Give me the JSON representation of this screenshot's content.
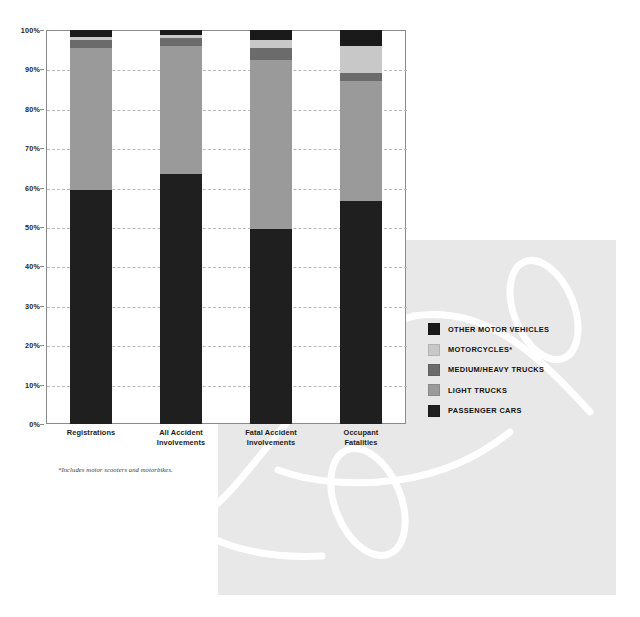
{
  "chart_data": {
    "type": "bar",
    "subtype": "stacked-bar-100-percent",
    "title": "",
    "xlabel": "",
    "ylabel": "",
    "ylim": [
      0,
      100
    ],
    "ytick_step": 10,
    "grid": true,
    "grid_style": "dashed horizontal",
    "legend_position": "right",
    "value_unit": "%",
    "categories": [
      "Registrations",
      "All Accident Involvements",
      "Fatal Accident Involvements",
      "Occupant Fatalities"
    ],
    "category_lines": [
      [
        "Registrations"
      ],
      [
        "All Accident",
        "Involvements"
      ],
      [
        "Fatal Accident",
        "Involvements"
      ],
      [
        "Occupant",
        "Fatalities"
      ]
    ],
    "series": [
      {
        "name": "PASSENGER CARS",
        "color": "#1f1f1f",
        "values": [
          59.5,
          63.5,
          49.5,
          56.5
        ]
      },
      {
        "name": "LIGHT TRUCKS",
        "color": "#9a9a9a",
        "values": [
          36.0,
          32.5,
          43.0,
          30.5
        ]
      },
      {
        "name": "MEDIUM/HEAVY TRUCKS",
        "color": "#6b6b6b",
        "values": [
          2.0,
          2.0,
          3.0,
          2.0
        ]
      },
      {
        "name": "MOTORCYCLES*",
        "color": "#c8c8c8",
        "values": [
          0.8,
          0.7,
          2.0,
          7.0
        ]
      },
      {
        "name": "OTHER MOTOR VEHICLES",
        "color": "#1a1a1a",
        "values": [
          1.7,
          1.3,
          2.5,
          4.0
        ]
      }
    ],
    "ytick_labels": [
      "0%",
      "10%",
      "20%",
      "30%",
      "40%",
      "50%",
      "60%",
      "70%",
      "80%",
      "90%",
      "100%"
    ],
    "annotations": [
      "*Includes motor scooters and motorbikes."
    ]
  },
  "legend": {
    "items": [
      {
        "label": "OTHER MOTOR VEHICLES",
        "color": "#1a1a1a"
      },
      {
        "label": "MOTORCYCLES*",
        "color": "#c8c8c8"
      },
      {
        "label": "MEDIUM/HEAVY TRUCKS",
        "color": "#6b6b6b"
      },
      {
        "label": "LIGHT TRUCKS",
        "color": "#9a9a9a"
      },
      {
        "label": "PASSENGER CARS",
        "color": "#1f1f1f"
      }
    ]
  },
  "footnote": {
    "text": "*Includes motor scooters and motorbikes."
  },
  "decoration": {
    "panel_color": "#e8e8e8",
    "line_art_color": "#ffffff",
    "name": "car-outline-line-art"
  }
}
